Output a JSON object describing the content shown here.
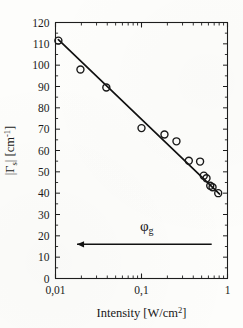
{
  "chart_data": {
    "type": "scatter",
    "title": "",
    "xlabel": "Intensity [W/cm",
    "xlabel_sup": "2",
    "xlabel_tail": "]",
    "ylabel_main": "|",
    "ylabel_gamma": "Γ",
    "ylabel_sub": "s",
    "ylabel_mid": "|  [cm",
    "ylabel_sup": "-1",
    "ylabel_tail": "]",
    "xscale": "log",
    "yscale": "linear",
    "xlim": [
      0.01,
      1
    ],
    "ylim": [
      0,
      120
    ],
    "grid": false,
    "legend": null,
    "xticks": [
      0.01,
      0.1,
      1
    ],
    "xticklabels": [
      "0,01",
      "0,1",
      "1"
    ],
    "yticks": [
      0,
      10,
      20,
      30,
      40,
      50,
      60,
      70,
      80,
      90,
      100,
      110,
      120
    ],
    "yticklabels": [
      "0",
      "10",
      "20",
      "30",
      "40",
      "50",
      "60",
      "70",
      "80",
      "90",
      "100",
      "110",
      "120"
    ],
    "marker": "open-circle",
    "marker_size": 7,
    "points": [
      {
        "x": 0.0108,
        "y": 111.5
      },
      {
        "x": 0.0195,
        "y": 98.0
      },
      {
        "x": 0.039,
        "y": 89.5
      },
      {
        "x": 0.1,
        "y": 70.5
      },
      {
        "x": 0.185,
        "y": 67.5
      },
      {
        "x": 0.255,
        "y": 64.3
      },
      {
        "x": 0.355,
        "y": 55.2
      },
      {
        "x": 0.48,
        "y": 54.8
      },
      {
        "x": 0.53,
        "y": 48.2
      },
      {
        "x": 0.57,
        "y": 47.0
      },
      {
        "x": 0.63,
        "y": 43.5
      },
      {
        "x": 0.67,
        "y": 42.8
      },
      {
        "x": 0.78,
        "y": 40.0
      }
    ],
    "fit_line": {
      "label": "linear fit on log axis",
      "x_start": 0.0108,
      "y_start": 112.0,
      "x_end": 0.81,
      "y_end": 39.6
    },
    "annotations": [
      {
        "name": "phi-g-arrow",
        "symbol": "φ",
        "subscript": "g",
        "arrow_direction": "left",
        "arrow_x_start": 0.655,
        "arrow_x_end": 0.0178,
        "arrow_y": 16.0,
        "label_x": 0.115,
        "label_y": 22.5
      }
    ]
  },
  "style": {
    "axis_color": "#1d1d1d",
    "marker_edge_color": "#181818",
    "line_color": "#111111",
    "background": "#fdfdfb",
    "text_color": "#1a1a1a"
  }
}
